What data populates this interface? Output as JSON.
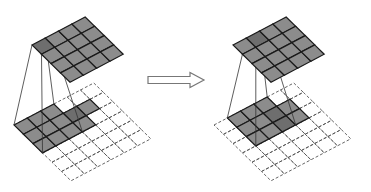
{
  "diagram": {
    "colors": {
      "background": "#ffffff",
      "cell_fill": "#8c8c8c",
      "cell_fill_highlight": "#6e6e6e",
      "grid_line": "#1a1a1a",
      "dashed_line": "#555555",
      "projection_line": "#333333",
      "arrow_stroke": "#777777"
    },
    "panels": [
      {
        "name": "before",
        "output": {
          "origin": [
            32,
            45
          ],
          "u": [
            13.3,
            -7.0
          ],
          "v": [
            9.5,
            9.3
          ],
          "rows": 4,
          "cols": 4,
          "highlight": [
            [
              0,
              0
            ]
          ]
        },
        "input": {
          "origin": [
            14,
            125
          ],
          "u": [
            13.3,
            -7.0
          ],
          "v": [
            9.5,
            9.3
          ],
          "rows": 6,
          "cols": 6,
          "window": {
            "row": 0,
            "col": 0,
            "size": 3
          },
          "extra_shaded": [
            [
              1,
              3
            ],
            [
              2,
              3
            ],
            [
              1,
              4
            ]
          ],
          "highlight": [
            [
              1,
              3
            ]
          ]
        },
        "projection_from": [
          0,
          0
        ]
      },
      {
        "name": "after",
        "output": {
          "origin": [
            233,
            45
          ],
          "u": [
            13.3,
            -7.0
          ],
          "v": [
            9.5,
            9.3
          ],
          "rows": 4,
          "cols": 4,
          "highlight": [
            [
              0,
              1
            ]
          ]
        },
        "input": {
          "origin": [
            214,
            125
          ],
          "u": [
            13.3,
            -7.0
          ],
          "v": [
            9.5,
            9.3
          ],
          "rows": 6,
          "cols": 6,
          "window": {
            "row": 0,
            "col": 1,
            "size": 3
          },
          "extra_shaded": [
            [
              1,
              4
            ],
            [
              2,
              4
            ]
          ],
          "highlight": [
            [
              1,
              3
            ],
            [
              2,
              3
            ]
          ]
        },
        "projection_from": [
          0,
          1
        ]
      }
    ],
    "arrow": {
      "x": 148,
      "y": 80,
      "length": 56,
      "shaft_height": 7,
      "head_width": 15,
      "head_length": 14,
      "direction": "right"
    }
  }
}
